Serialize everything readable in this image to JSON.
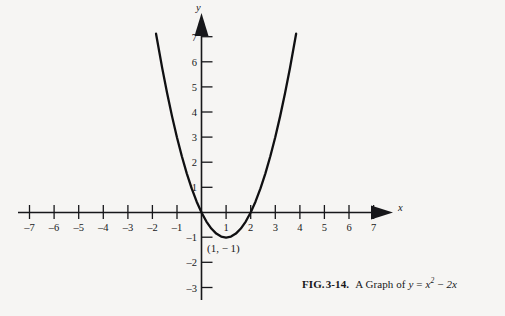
{
  "figure": {
    "caption": {
      "fig_label": "FIG.",
      "number": "3-14.",
      "lead_text": "A Graph of",
      "equation_lhs": "y",
      "equation_eq": "=",
      "equation_x": "x",
      "equation_exp": "2",
      "equation_minus": "−",
      "equation_term": "2x"
    },
    "axes": {
      "x_axis_name": "x",
      "y_axis_name": "y"
    },
    "annotations": [
      {
        "name": "vertex-label",
        "text": "(1, − 1)",
        "x": 1,
        "y": -1
      }
    ]
  },
  "chart_data": {
    "type": "line",
    "subtitle": "FIG. 3-14.",
    "xlabel": "x",
    "ylabel": "y",
    "grid": false,
    "legend": "none",
    "equation": "y = x^2 - 2x",
    "xlim": [
      -7.6,
      7.6
    ],
    "ylim": [
      -3.6,
      7.8
    ],
    "xticks": [
      -7,
      -6,
      -5,
      -4,
      -3,
      -2,
      -1,
      1,
      2,
      3,
      4,
      5,
      6,
      7
    ],
    "yticks": [
      -3,
      -2,
      -1,
      1,
      2,
      3,
      4,
      5,
      6,
      7
    ],
    "xtick_labels": [
      "–7",
      "–6",
      "–5",
      "–4",
      "–3",
      "–2",
      "–1",
      "1",
      "2",
      "3",
      "4",
      "5",
      "6",
      "7"
    ],
    "ytick_labels": [
      "–3",
      "–2",
      "–1",
      "1",
      "2",
      "3",
      "4",
      "5",
      "6",
      "7"
    ],
    "curve_domain": [
      -1.85,
      3.85
    ],
    "vertex": [
      1,
      -1
    ],
    "roots": [
      0,
      2
    ],
    "annotations": [
      "(1, − 1)"
    ],
    "series": [
      {
        "name": "y = x^2 - 2x",
        "x": [
          -1.85,
          -1.6,
          -1.4,
          -1.2,
          -1.0,
          -0.8,
          -0.6,
          -0.4,
          -0.2,
          0.0,
          0.2,
          0.4,
          0.6,
          0.8,
          1.0,
          1.2,
          1.4,
          1.6,
          1.8,
          2.0,
          2.2,
          2.4,
          2.6,
          2.8,
          3.0,
          3.2,
          3.4,
          3.6,
          3.85
        ],
        "y": [
          7.1225,
          5.76,
          4.76,
          3.84,
          3.0,
          2.24,
          1.56,
          0.96,
          0.44,
          0.0,
          -0.36,
          -0.64,
          -0.84,
          -0.96,
          -1.0,
          -0.96,
          -0.84,
          -0.64,
          -0.36,
          0.0,
          0.44,
          0.96,
          1.56,
          2.24,
          3.0,
          3.84,
          4.76,
          5.76,
          7.1225
        ]
      }
    ]
  }
}
